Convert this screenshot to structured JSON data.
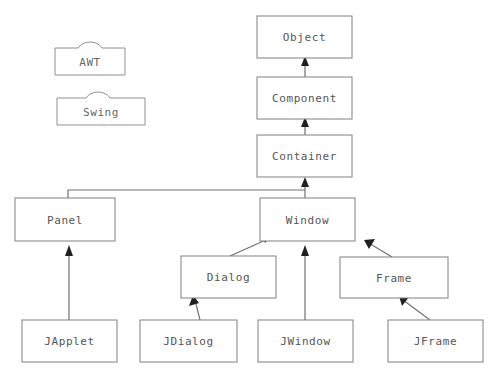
{
  "diagram": {
    "type": "class-inheritance-diagram",
    "background_color": "#ffffff",
    "box_fill_color": "#ffffff",
    "box_border_color": "#808080",
    "text_color": "#555555",
    "edge_color": "#707070",
    "arrowhead_color": "#202020"
  },
  "legend": {
    "items": [
      {
        "id": "awt",
        "label": "AWT",
        "icon": "folder-icon",
        "x": 55,
        "y": 42,
        "width": 70,
        "height": 33
      },
      {
        "id": "swing",
        "label": "Swing",
        "icon": "folder-icon",
        "x": 57,
        "y": 92,
        "width": 88,
        "height": 33
      }
    ]
  },
  "nodes": [
    {
      "id": "object",
      "label": "Object",
      "x": 257,
      "y": 16,
      "width": 95,
      "height": 42
    },
    {
      "id": "component",
      "label": "Component",
      "x": 257,
      "y": 77,
      "width": 95,
      "height": 42
    },
    {
      "id": "container",
      "label": "Container",
      "x": 257,
      "y": 135,
      "width": 95,
      "height": 42
    },
    {
      "id": "panel",
      "label": "Panel",
      "x": 15,
      "y": 198,
      "width": 100,
      "height": 43
    },
    {
      "id": "window",
      "label": "Window",
      "x": 260,
      "y": 198,
      "width": 95,
      "height": 43
    },
    {
      "id": "dialog",
      "label": "Dialog",
      "x": 181,
      "y": 256,
      "width": 95,
      "height": 42
    },
    {
      "id": "frame",
      "label": "Frame",
      "x": 340,
      "y": 257,
      "width": 108,
      "height": 41
    },
    {
      "id": "japplet",
      "label": "JApplet",
      "x": 22,
      "y": 320,
      "width": 95,
      "height": 42
    },
    {
      "id": "jdialog",
      "label": "JDialog",
      "x": 140,
      "y": 320,
      "width": 97,
      "height": 42
    },
    {
      "id": "jwindow",
      "label": "JWindow",
      "x": 258,
      "y": 320,
      "width": 95,
      "height": 42
    },
    {
      "id": "jframe",
      "label": "JFrame",
      "x": 388,
      "y": 320,
      "width": 95,
      "height": 42
    }
  ],
  "edges": [
    {
      "id": "component-to-object",
      "from": "component",
      "to": "object",
      "kind": "vertical",
      "path": "M 305 77 L 305 62",
      "head": "305,56 301,66 309,66"
    },
    {
      "id": "container-to-component",
      "from": "container",
      "to": "component",
      "kind": "vertical",
      "path": "M 305 135 L 305 123",
      "head": "305,117 301,127 309,127"
    },
    {
      "id": "window-to-container",
      "from": "window",
      "to": "container",
      "kind": "vertical",
      "path": "M 305 198 L 305 183",
      "head": "305,177 301,187 309,187"
    },
    {
      "id": "panel-to-container",
      "from": "panel",
      "to": "container",
      "kind": "elbow",
      "path": "M 68 198 L 68 190 L 305 190",
      "head": ""
    },
    {
      "id": "japplet-to-panel",
      "from": "japplet",
      "to": "panel",
      "kind": "vertical",
      "path": "M 69 320 L 69 252",
      "head": "69,245 65,256 73,256"
    },
    {
      "id": "jwindow-to-window",
      "from": "jwindow",
      "to": "window",
      "kind": "vertical",
      "path": "M 305 320 L 305 252",
      "head": "305,245 301,256 309,256"
    },
    {
      "id": "dialog-to-window",
      "from": "dialog",
      "to": "window",
      "kind": "diagonal",
      "path": "M 230 256 L 268 239",
      "head": "265,243 261,233 272,234"
    },
    {
      "id": "frame-to-window",
      "from": "frame",
      "to": "window",
      "kind": "diagonal",
      "path": "M 392 257 L 367 242",
      "head": "364,240 375,239 369,249"
    },
    {
      "id": "jdialog-to-dialog",
      "from": "jdialog",
      "to": "dialog",
      "kind": "diagonal",
      "path": "M 200 320 L 195 300",
      "head": "193,295 189,306 199,303"
    },
    {
      "id": "jframe-to-frame",
      "from": "jframe",
      "to": "frame",
      "kind": "diagonal",
      "path": "M 430 320 L 403 300",
      "head": "399,296 409,297 402,306"
    }
  ]
}
